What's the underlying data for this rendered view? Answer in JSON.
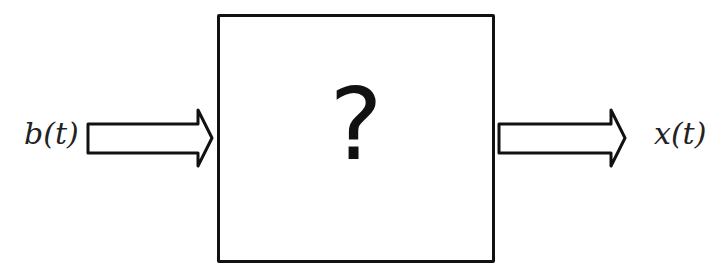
{
  "diagram": {
    "input_label": "b(t)",
    "output_label": "x(t)",
    "box_symbol": "?",
    "colors": {
      "stroke": "#111111",
      "background": "#ffffff"
    }
  }
}
